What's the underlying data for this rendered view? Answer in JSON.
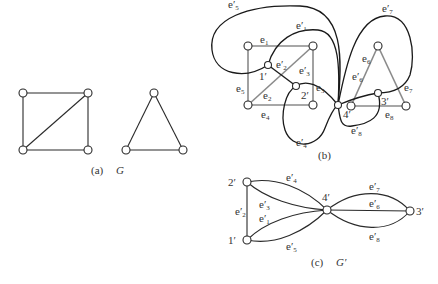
{
  "figure": {
    "panel_a": {
      "caption_tag": "(a)",
      "caption_name": "G",
      "description": "Graph G: a square with one diagonal, and a separate triangle"
    },
    "panel_b": {
      "caption_tag": "(b)",
      "primal_edge_labels": {
        "e1": "e",
        "e1_sub": "1",
        "e2": "e",
        "e2_sub": "2",
        "e3": "e",
        "e3_sub": "3",
        "e4": "e",
        "e4_sub": "4",
        "e5": "e",
        "e5_sub": "5",
        "e6": "e",
        "e6_sub": "6",
        "e7": "e",
        "e7_sub": "7",
        "e8": "e",
        "e8_sub": "8"
      },
      "dual_edge_labels": {
        "e1p": "e′",
        "e1p_sub": "1",
        "e2p": "e′",
        "e2p_sub": "2",
        "e3p": "e′",
        "e3p_sub": "3",
        "e4p": "e′",
        "e4p_sub": "4",
        "e5p": "e′",
        "e5p_sub": "5",
        "e6p": "e′",
        "e6p_sub": "6",
        "e7p": "e′",
        "e7p_sub": "7",
        "e8p": "e′",
        "e8p_sub": "8"
      },
      "dual_vertex_labels": {
        "v1": "1′",
        "v2": "2′",
        "v3": "3′",
        "v4": "4′"
      }
    },
    "panel_c": {
      "caption_tag": "(c)",
      "caption_name": "G′",
      "vertex_labels": {
        "v1": "1′",
        "v2": "2′",
        "v3": "3′",
        "v4": "4′"
      },
      "edge_labels": {
        "e2p": "e′",
        "e2p_sub": "2",
        "e3p": "e′",
        "e3p_sub": "3",
        "e1p": "e′",
        "e1p_sub": "1",
        "e4p": "e′",
        "e4p_sub": "4",
        "e5p": "e′",
        "e5p_sub": "5",
        "e6p": "e′",
        "e6p_sub": "6",
        "e7p": "e′",
        "e7p_sub": "7",
        "e8p": "e′",
        "e8p_sub": "8"
      }
    }
  }
}
